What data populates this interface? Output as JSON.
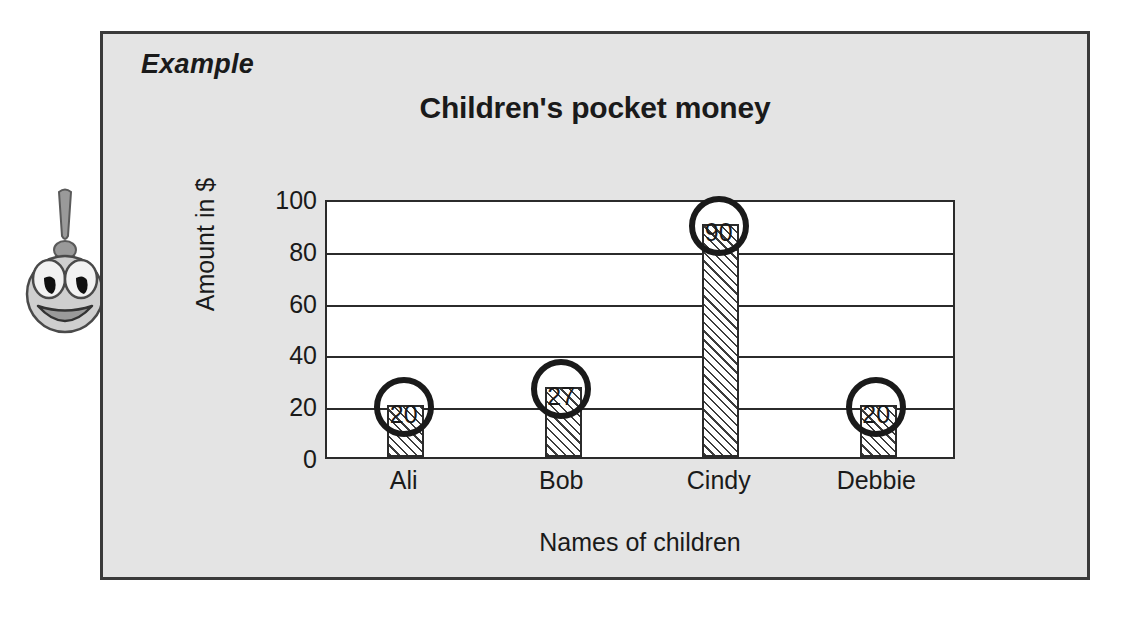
{
  "panel": {
    "example_label": "Example"
  },
  "mascot": {
    "icon": "exclamation-smiley-face-icon"
  },
  "chart_data": {
    "type": "bar",
    "title": "Children's pocket money",
    "xlabel": "Names of children",
    "ylabel": "Amount in $",
    "categories": [
      "Ali",
      "Bob",
      "Cindy",
      "Debbie"
    ],
    "values": [
      20,
      27,
      90,
      20
    ],
    "annotations": [
      "20",
      "27",
      "90",
      "20"
    ],
    "ylim": [
      0,
      100
    ],
    "yticks": [
      "0",
      "20",
      "40",
      "60",
      "80",
      "100"
    ],
    "ytick_values": [
      0,
      20,
      40,
      60,
      80,
      100
    ],
    "grid": true,
    "legend": "none",
    "bar_fill": "diagonal-hatch",
    "colors": {
      "plot_background": "#ffffff",
      "panel_background": "#e4e4e4",
      "ink": "#1a1a1a",
      "axis": "#2b2b2b"
    }
  }
}
